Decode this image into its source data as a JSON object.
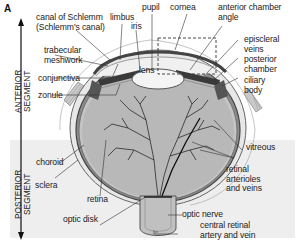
{
  "figure": {
    "panel_letter": "A",
    "segments": {
      "anterior": [
        "ANTERIOR",
        "SEGMENT"
      ],
      "posterior": [
        "POSTERIOR",
        "SEGMENT"
      ]
    },
    "labels": {
      "canal_of_schlemm": [
        "canal of Schlemm",
        "(Schlemm's canal)"
      ],
      "limbus": "limbus",
      "pupil": "pupil",
      "cornea": "cornea",
      "iris": "iris",
      "anterior_chamber_angle": [
        "anterior chamber",
        "angle"
      ],
      "trabecular_meshwork": [
        "trabecular",
        "meshwork"
      ],
      "episcleral_veins": [
        "episcleral",
        "veins"
      ],
      "posterior_chamber": [
        "posterior",
        "chamber"
      ],
      "lens": "lens",
      "conjunctiva": "conjunctiva",
      "ciliary_body": [
        "ciliary",
        "body"
      ],
      "zonule": "zonule",
      "vitreous": "vitreous",
      "choroid": "choroid",
      "sclera": "sclera",
      "retina": "retina",
      "retinal_arterioles_and_veins": [
        "retinal",
        "arterioles",
        "and veins"
      ],
      "optic_nerve": "optic nerve",
      "optic_disk": "optic disk",
      "central_retinal_artery_and_vein": [
        "central retinal",
        "artery and vein"
      ]
    },
    "colors": {
      "posterior_background": "#eeeeee",
      "vitreous_fill": "#b8b8b8",
      "sclera_fill": "#e8e8e8",
      "choroid": "#555555",
      "vessels": "#2a2a2a",
      "lens_fill": "#f4f4f4",
      "leader_lines": "#333333"
    }
  }
}
